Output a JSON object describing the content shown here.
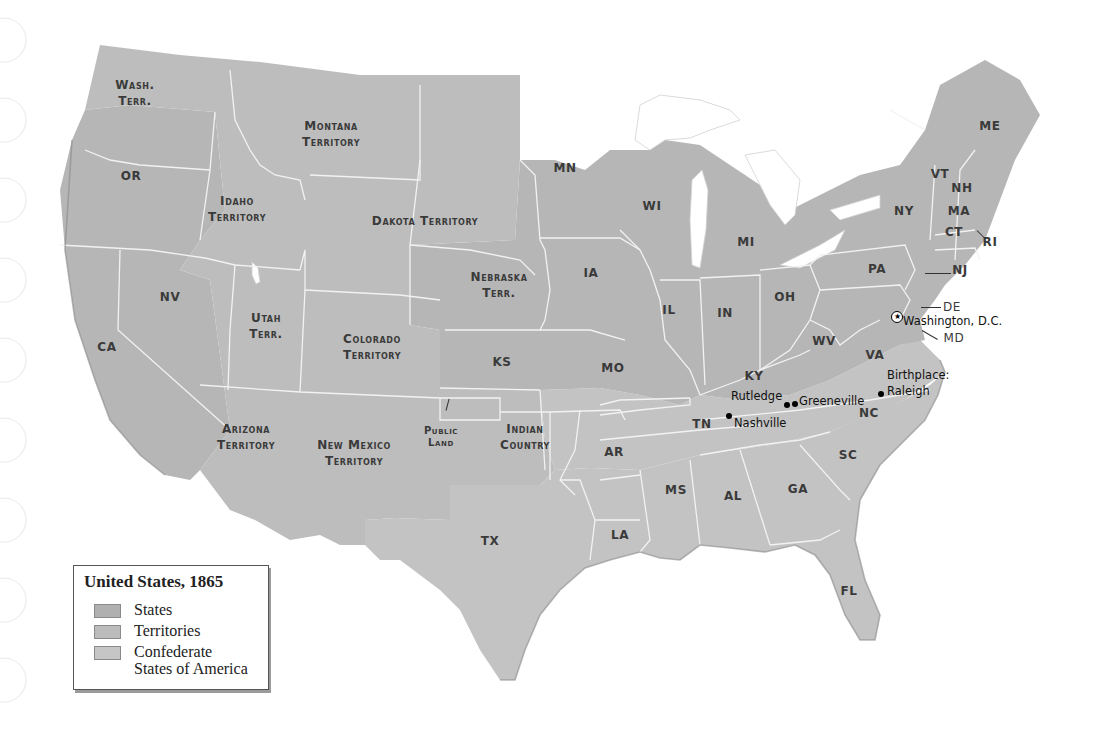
{
  "map": {
    "title": "United States, 1865",
    "colors": {
      "states": "#b6b6b6",
      "territories": "#bdbdbd",
      "confederate": "#c3c3c3",
      "border": "#f2f2f2",
      "label": "#3a3a3a"
    },
    "legend": {
      "title": "United States, 1865",
      "items": [
        {
          "label": "States",
          "color": "#b0b0b0"
        },
        {
          "label": "Territories",
          "color": "#bcbcbc"
        },
        {
          "label": "Confederate",
          "label2": "States of America",
          "color": "#c6c6c6"
        }
      ]
    },
    "regions": {
      "wash": {
        "l1": "Wash.",
        "l2": "Terr."
      },
      "montana": {
        "l1": "Montana",
        "l2": "Territory"
      },
      "or": "OR",
      "idaho": {
        "l1": "Idaho",
        "l2": "Territory"
      },
      "dakota": "Dakota Territory",
      "mn": "MN",
      "wi": "WI",
      "mi": "MI",
      "ny": "NY",
      "me": "ME",
      "vt": "VT",
      "nh": "NH",
      "ma": "MA",
      "ct": "CT",
      "ri": "RI",
      "nj": "NJ",
      "pa": "PA",
      "de": "DE",
      "md": "MD",
      "nebraska": {
        "l1": "Nebraska",
        "l2": "Terr."
      },
      "ia": "IA",
      "il": "IL",
      "in": "IN",
      "oh": "OH",
      "nv": "NV",
      "utah": {
        "l1": "Utah",
        "l2": "Terr."
      },
      "colorado": {
        "l1": "Colorado",
        "l2": "Territory"
      },
      "ca": "CA",
      "ks": "KS",
      "mo": "MO",
      "ky": "KY",
      "wv": "WV",
      "va": "VA",
      "tn": "TN",
      "nc": "NC",
      "sc": "SC",
      "ga": "GA",
      "al": "AL",
      "ms": "MS",
      "ar": "AR",
      "la": "LA",
      "tx": "TX",
      "fl": "FL",
      "arizona": {
        "l1": "Arizona",
        "l2": "Territory"
      },
      "newmexico": {
        "l1": "New Mexico",
        "l2": "Territory"
      },
      "public": {
        "l1": "Public",
        "l2": "Land"
      },
      "indian": {
        "l1": "Indian",
        "l2": "Country"
      }
    },
    "cities": {
      "washington": "Washington, D.C.",
      "birthplace": "Birthplace:",
      "raleigh": "Raleigh",
      "rutledge": "Rutledge",
      "greeneville": "Greeneville",
      "nashville": "Nashville"
    },
    "star_glyph": "★"
  }
}
